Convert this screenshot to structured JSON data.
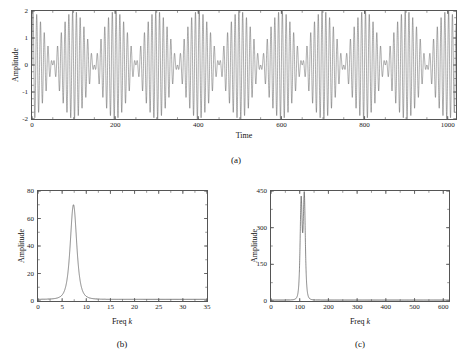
{
  "figure": {
    "caption_a": "(a)",
    "caption_b": "(b)",
    "caption_c": "(c)",
    "line_color": "#3a3a3a",
    "axis_color": "#555555"
  },
  "chart_data": [
    {
      "id": "panel-a",
      "type": "line",
      "title": "",
      "xlabel": "Time",
      "ylabel": "Amplitude",
      "xlim": [
        0,
        1020
      ],
      "ylim": [
        -2,
        2
      ],
      "xticks": [
        0,
        200,
        400,
        600,
        800,
        1000
      ],
      "xticklabels": [
        "0",
        "200",
        "400",
        "600",
        "800",
        "1000"
      ],
      "yticks": [
        -2,
        -1,
        0,
        1,
        2
      ],
      "yticklabels": [
        "-2",
        "-1",
        "0",
        "1",
        "2"
      ],
      "grid": false,
      "legend": null,
      "description": "Amplitude-modulated beat waveform formed by the sum of two sinusoids of nearly equal frequency",
      "signal_model": {
        "form": "y(t) = sin(2*pi*f1*t) + sin(2*pi*f2*t)",
        "f1": 0.105,
        "f2": 0.115,
        "beat_period": 100,
        "carrier_period": 9.09,
        "envelope_peak": 2.0,
        "num_beats_visible": 10,
        "node_positions": [
          0,
          100,
          200,
          300,
          400,
          500,
          600,
          700,
          800,
          900,
          1000
        ]
      }
    },
    {
      "id": "panel-b",
      "type": "line",
      "title": "",
      "xlabel": "Freq k",
      "xlabel_italic_part": "k",
      "ylabel": "Amplitude",
      "xlim": [
        0,
        35
      ],
      "ylim": [
        0,
        80
      ],
      "xticks": [
        0,
        5,
        10,
        15,
        20,
        25,
        30,
        35
      ],
      "xticklabels": [
        "0",
        "5",
        "10",
        "15",
        "20",
        "25",
        "30",
        "35"
      ],
      "yticks": [
        0,
        20,
        40,
        60,
        80
      ],
      "yticklabels": [
        "0",
        "20",
        "40",
        "60",
        "80"
      ],
      "grid": false,
      "legend": null,
      "description": "Short-record DFT magnitude spectrum: the two close tones are unresolved and merge into one broad peak",
      "peaks": [
        {
          "x": 7.35,
          "y": 70.0,
          "half_width": 0.85
        }
      ],
      "baseline": 1.2
    },
    {
      "id": "panel-c",
      "type": "line",
      "title": "",
      "xlabel": "Freq k",
      "xlabel_italic_part": "k",
      "ylabel": "Amplitude",
      "xlim": [
        0,
        620
      ],
      "ylim": [
        0,
        450
      ],
      "xticks": [
        0,
        100,
        200,
        300,
        400,
        500,
        600
      ],
      "xticklabels": [
        "0",
        "100",
        "200",
        "300",
        "400",
        "500",
        "600"
      ],
      "yticks": [
        0,
        150,
        300,
        450
      ],
      "yticklabels": [
        "0",
        "150",
        "300",
        "450"
      ],
      "grid": false,
      "legend": null,
      "description": "Long-record DFT magnitude spectrum: the two tones are fully resolved as twin narrow peaks",
      "peaks": [
        {
          "x": 105,
          "y": 400.0,
          "half_width": 4.5
        },
        {
          "x": 116,
          "y": 420.0,
          "half_width": 4.5
        }
      ],
      "baseline": 4.0
    }
  ]
}
